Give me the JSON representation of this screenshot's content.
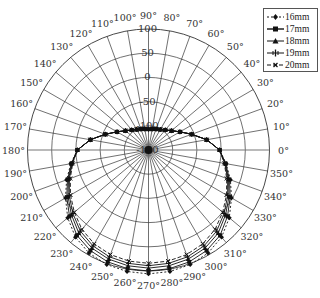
{
  "chart_data": {
    "type": "polar-line",
    "title": "",
    "angular_axis": {
      "unit": "degree",
      "ticks": [
        0,
        10,
        20,
        30,
        40,
        50,
        60,
        70,
        80,
        90,
        100,
        110,
        120,
        130,
        140,
        150,
        160,
        170,
        180,
        190,
        200,
        210,
        220,
        230,
        240,
        250,
        260,
        270,
        280,
        290,
        300,
        310,
        320,
        330,
        340,
        350
      ],
      "tick_labels": [
        "0°",
        "10°",
        "20°",
        "30°",
        "40°",
        "50°",
        "60°",
        "70°",
        "80°",
        "90°",
        "100°",
        "110°",
        "120°",
        "130°",
        "140°",
        "150°",
        "160°",
        "170°",
        "180°",
        "190°",
        "200°",
        "210°",
        "220°",
        "230°",
        "240°",
        "250°",
        "260°",
        "270°",
        "280°",
        "290°",
        "300°",
        "310°",
        "320°",
        "330°",
        "340°",
        "350°"
      ],
      "direction": "counterclockwise",
      "zero_location": "east"
    },
    "radial_axis": {
      "range": [
        -150,
        100
      ],
      "ticks": [
        -150,
        -100,
        -50,
        0,
        50,
        100
      ],
      "tick_labels": [
        "-150",
        "-100",
        "-50",
        "0",
        "50",
        "100"
      ],
      "label_angle_deg": 90
    },
    "grid": true,
    "legend": {
      "position": "top-right",
      "entries": [
        "16mm",
        "17mm",
        "18mm",
        "19mm",
        "20mm"
      ]
    },
    "theta": [
      0,
      10,
      20,
      30,
      40,
      50,
      60,
      70,
      80,
      90,
      100,
      110,
      120,
      130,
      140,
      150,
      160,
      170,
      180,
      190,
      200,
      210,
      220,
      230,
      240,
      250,
      260,
      270,
      280,
      290,
      300,
      310,
      320,
      330,
      340,
      350
    ],
    "series": [
      {
        "name": "16mm",
        "marker": "diamond",
        "dash": "2,2",
        "values": [
          -3,
          -28,
          -55,
          -75,
          -88,
          -96,
          -101,
          -104,
          -106,
          -107,
          -106,
          -104,
          -101,
          -96,
          -88,
          -75,
          -55,
          -28,
          -3,
          13,
          30,
          48,
          68,
          85,
          96,
          102,
          105,
          106,
          105,
          102,
          96,
          85,
          68,
          48,
          30,
          13
        ]
      },
      {
        "name": "17mm",
        "marker": "square",
        "dash": "",
        "values": [
          -3,
          -28,
          -55,
          -75,
          -88,
          -96,
          -101,
          -104,
          -106,
          -107,
          -106,
          -104,
          -101,
          -96,
          -88,
          -75,
          -55,
          -28,
          -3,
          12,
          28,
          45,
          63,
          80,
          90,
          96,
          99,
          100,
          99,
          96,
          90,
          80,
          63,
          45,
          28,
          12
        ]
      },
      {
        "name": "18mm",
        "marker": "triangle",
        "dash": "",
        "values": [
          -3,
          -28,
          -55,
          -75,
          -88,
          -96,
          -101,
          -104,
          -106,
          -107,
          -106,
          -104,
          -101,
          -96,
          -88,
          -75,
          -55,
          -28,
          -3,
          11,
          26,
          42,
          58,
          74,
          84,
          90,
          93,
          94,
          93,
          90,
          84,
          74,
          58,
          42,
          26,
          11
        ]
      },
      {
        "name": "19mm",
        "marker": "cross",
        "dash": "",
        "values": [
          -3,
          -28,
          -55,
          -75,
          -88,
          -96,
          -101,
          -104,
          -106,
          -107,
          -106,
          -104,
          -101,
          -96,
          -88,
          -75,
          -55,
          -28,
          -3,
          10,
          24,
          39,
          54,
          69,
          79,
          85,
          88,
          89,
          88,
          85,
          79,
          69,
          54,
          39,
          24,
          10
        ]
      },
      {
        "name": "20mm",
        "marker": "x",
        "dash": "4,2",
        "values": [
          -3,
          -28,
          -55,
          -75,
          -88,
          -96,
          -101,
          -104,
          -106,
          -107,
          -106,
          -104,
          -101,
          -96,
          -88,
          -75,
          -55,
          -28,
          -3,
          9,
          22,
          36,
          50,
          64,
          74,
          80,
          83,
          84,
          83,
          80,
          74,
          64,
          50,
          36,
          22,
          9
        ]
      }
    ]
  },
  "legend": {
    "items": [
      {
        "label": "16mm",
        "marker": "diamond"
      },
      {
        "label": "17mm",
        "marker": "square"
      },
      {
        "label": "18mm",
        "marker": "triangle"
      },
      {
        "label": "19mm",
        "marker": "cross"
      },
      {
        "label": "20mm",
        "marker": "x"
      }
    ]
  },
  "colors": {
    "line": "#111111",
    "grid": "#333333",
    "text": "#333333",
    "background": "#ffffff"
  }
}
